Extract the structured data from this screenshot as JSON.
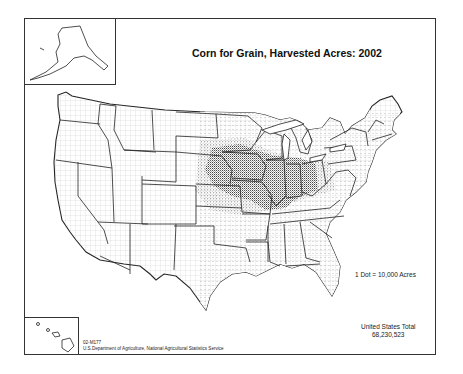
{
  "map": {
    "title": "Corn for Grain, Harvested Acres:  2002",
    "legend": {
      "dot_value_label": "1 Dot = 10,000 Acres"
    },
    "total": {
      "label": "United States Total",
      "value": "68,230,523"
    },
    "credit": {
      "map_id": "02-M177",
      "source": "U.S.Department of Agriculture, National Agricultural Statistics Service"
    },
    "insets": {
      "alaska": "Alaska inset",
      "hawaii": "Hawaii inset"
    },
    "colors": {
      "ink": "#222222",
      "background": "#ffffff"
    }
  }
}
